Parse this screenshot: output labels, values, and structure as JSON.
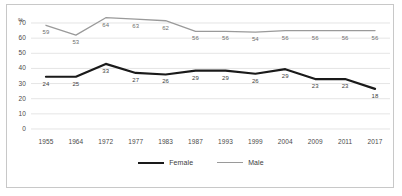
{
  "chart_data": {
    "type": "line",
    "title": "",
    "xlabel": "",
    "ylabel": "%",
    "ylim": [
      0,
      70
    ],
    "yticks": [
      0,
      10,
      20,
      30,
      40,
      50,
      60,
      70
    ],
    "grid": true,
    "legend_position": "bottom",
    "categories": [
      "1955",
      "1964",
      "1972",
      "1977",
      "1983",
      "1987",
      "1993",
      "1999",
      "2004",
      "2009",
      "2011",
      "2017"
    ],
    "series": [
      {
        "name": "Female",
        "color": "#1a1a1a",
        "values": [
          24,
          25,
          33,
          27,
          26,
          29,
          29,
          26,
          29,
          23,
          23,
          18
        ],
        "plotted": [
          34.5,
          34.5,
          43,
          37,
          36,
          38.5,
          38.5,
          36.5,
          39.5,
          33,
          33,
          26.5
        ]
      },
      {
        "name": "Male",
        "color": "#9a9a9a",
        "values": [
          59,
          53,
          64,
          63,
          62,
          56,
          56,
          54,
          56,
          56,
          56,
          56
        ],
        "plotted": [
          68.5,
          62,
          73.5,
          72.5,
          71.5,
          64.5,
          64.5,
          64,
          65,
          65,
          65,
          65
        ]
      }
    ]
  },
  "legend": {
    "items": [
      {
        "label": "Female"
      },
      {
        "label": "Male"
      }
    ]
  }
}
